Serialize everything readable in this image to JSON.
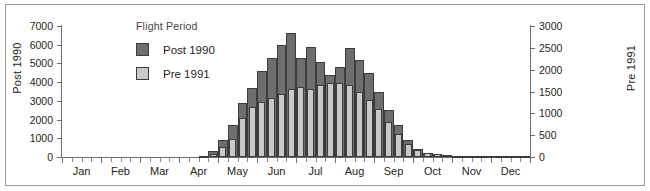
{
  "figure": {
    "left_axis_title": "Post 1990",
    "right_axis_title": "Pre 1991"
  },
  "legend": {
    "title": "Flight Period",
    "items": [
      {
        "label": "Post 1990",
        "color": "#6e6e6e",
        "key": "post_1990"
      },
      {
        "label": "Pre 1991",
        "color": "#c9c9c9",
        "key": "pre_1991"
      }
    ]
  },
  "chart_data": {
    "type": "bar",
    "title": "",
    "subtitle": "",
    "xlabel": "",
    "ylabel": "Post 1990",
    "y2label": "Pre 1991",
    "ylim": [
      0,
      7000
    ],
    "y2lim": [
      0,
      3000
    ],
    "yticks": [
      0,
      1000,
      2000,
      3000,
      4000,
      5000,
      6000,
      7000
    ],
    "y2ticks": [
      0,
      500,
      1000,
      1500,
      2000,
      2500,
      3000
    ],
    "grid": false,
    "legend_position": "upper-left-inside",
    "bar_mode": "overlay",
    "x_tick_labels": [
      "Jan",
      "Feb",
      "Mar",
      "Apr",
      "May",
      "Jun",
      "Jul",
      "Aug",
      "Sep",
      "Oct",
      "Nov",
      "Dec"
    ],
    "x_bin": "week",
    "x_bins_per_month": 4,
    "x_total_bins": 48,
    "series": [
      {
        "name": "Post 1990",
        "axis": "left",
        "color": "#6e6e6e",
        "values": [
          0,
          0,
          0,
          0,
          0,
          0,
          0,
          0,
          0,
          0,
          0,
          0,
          0,
          0,
          60,
          320,
          900,
          1700,
          2900,
          3700,
          4600,
          5300,
          6000,
          6600,
          5300,
          5900,
          5100,
          4400,
          4800,
          5800,
          5200,
          4500,
          3500,
          2500,
          1700,
          900,
          420,
          230,
          140,
          90,
          60,
          40,
          30,
          20,
          15,
          10,
          8,
          5
        ]
      },
      {
        "name": "Pre 1991",
        "axis": "right",
        "color": "#c9c9c9",
        "values": [
          0,
          0,
          0,
          0,
          0,
          0,
          0,
          0,
          0,
          0,
          0,
          0,
          0,
          0,
          10,
          60,
          230,
          420,
          900,
          1150,
          1250,
          1350,
          1450,
          1550,
          1600,
          1550,
          1650,
          1700,
          1700,
          1650,
          1500,
          1300,
          1100,
          800,
          520,
          300,
          170,
          100,
          60,
          35,
          25,
          18,
          12,
          8,
          6,
          4,
          3,
          2
        ]
      }
    ]
  }
}
